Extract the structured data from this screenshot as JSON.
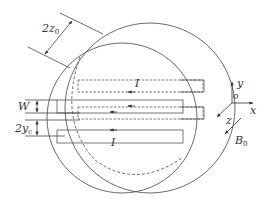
{
  "diagram": {
    "labels": {
      "thickness": "2z",
      "thickness_sub": "0",
      "width": "W",
      "gap": "2y",
      "gap_sub": "c",
      "current_top": "I",
      "current_bottom": "I",
      "axis_y": "y",
      "axis_origin": "o",
      "axis_x": "x",
      "axis_z": "z",
      "field": "B",
      "field_sub": "0"
    },
    "colors": {
      "stroke": "#444444",
      "background": "#ffffff"
    }
  }
}
